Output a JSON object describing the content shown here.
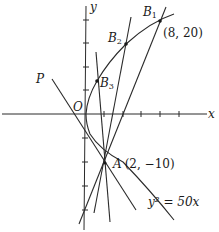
{
  "diagram": {
    "curve": {
      "equation": "y² = 50x"
    },
    "axes": {
      "x_label": "x",
      "y_label": "y",
      "origin_label": "O"
    },
    "points": {
      "A": {
        "label": "A",
        "coords": "(2, −10)"
      },
      "B1": {
        "label": "B",
        "sub": "1",
        "coords": "(8, 20)"
      },
      "B2": {
        "label": "B",
        "sub": "2"
      },
      "B3": {
        "label": "B",
        "sub": "3"
      },
      "P": {
        "label": "P"
      }
    },
    "colors": {
      "ink": "#2a2a2a",
      "background": "#ffffff"
    }
  }
}
